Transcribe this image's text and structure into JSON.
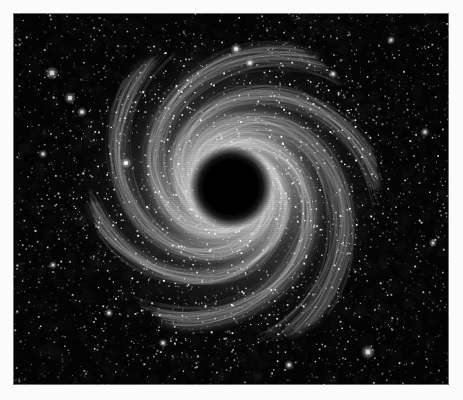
{
  "figure": {
    "title": "Spiral galaxy photographic plate",
    "medium": "monochrome astronomical photographic plate",
    "canvas_width": 463,
    "canvas_height": 400,
    "margin_color": "#fbfbfb",
    "plate": {
      "x": 13,
      "y": 13,
      "width": 436,
      "height": 372,
      "background_color": "#050505",
      "border_color": "#c8c8c8"
    },
    "has_visible_text": false,
    "visible_labels": []
  },
  "chart_data": {
    "type": "scatter",
    "title": "",
    "xlabel": "",
    "ylabel": "",
    "grid": false,
    "legend": null,
    "xlim": [
      0,
      436
    ],
    "ylim": [
      0,
      372
    ],
    "galaxy": {
      "name": "face-on spiral galaxy",
      "center_x": 218,
      "center_y": 174,
      "core": {
        "kind": "saturated-dark-nucleus",
        "color": "#000000",
        "radius": 26,
        "soft_edge_radius": 42
      },
      "halo": {
        "inner_radius": 30,
        "outer_radius": 165,
        "peak_brightness": 0.86,
        "color_bright": "#e8e8e8",
        "color_mid": "#9a9a9a",
        "color_faint": "#3a3a3a"
      },
      "arm_count": 6,
      "arm_winding": "counterclockwise",
      "arm_pitch_deg": 19,
      "arms": [
        {
          "start_angle_deg": 10,
          "length": 155,
          "brightness": 0.92,
          "width": 22
        },
        {
          "start_angle_deg": 70,
          "length": 148,
          "brightness": 0.8,
          "width": 20
        },
        {
          "start_angle_deg": 128,
          "length": 160,
          "brightness": 0.88,
          "width": 24
        },
        {
          "start_angle_deg": 190,
          "length": 150,
          "brightness": 0.95,
          "width": 23
        },
        {
          "start_angle_deg": 250,
          "length": 142,
          "brightness": 0.78,
          "width": 19
        },
        {
          "start_angle_deg": 305,
          "length": 152,
          "brightness": 0.85,
          "width": 21
        }
      ]
    },
    "starfield": {
      "count": 5200,
      "seed": 20240517,
      "radius_range": [
        0.4,
        1.9
      ],
      "brightness_range": [
        0.12,
        1.0
      ],
      "color": "#ffffff"
    },
    "bright_stars": [
      {
        "x": 39,
        "y": 60,
        "r": 2.6,
        "b": 1.0
      },
      {
        "x": 57,
        "y": 85,
        "r": 2.3,
        "b": 0.96
      },
      {
        "x": 69,
        "y": 99,
        "r": 2.0,
        "b": 0.9
      },
      {
        "x": 30,
        "y": 141,
        "r": 1.8,
        "b": 0.84
      },
      {
        "x": 113,
        "y": 150,
        "r": 2.2,
        "b": 0.95
      },
      {
        "x": 223,
        "y": 36,
        "r": 2.2,
        "b": 0.94
      },
      {
        "x": 237,
        "y": 50,
        "r": 1.9,
        "b": 0.88
      },
      {
        "x": 320,
        "y": 61,
        "r": 1.8,
        "b": 0.86
      },
      {
        "x": 378,
        "y": 27,
        "r": 1.8,
        "b": 0.85
      },
      {
        "x": 412,
        "y": 119,
        "r": 1.9,
        "b": 0.88
      },
      {
        "x": 355,
        "y": 339,
        "r": 2.8,
        "b": 1.0
      },
      {
        "x": 276,
        "y": 352,
        "r": 1.9,
        "b": 0.88
      },
      {
        "x": 96,
        "y": 300,
        "r": 1.8,
        "b": 0.84
      },
      {
        "x": 150,
        "y": 330,
        "r": 1.8,
        "b": 0.82
      },
      {
        "x": 420,
        "y": 230,
        "r": 1.7,
        "b": 0.82
      },
      {
        "x": 40,
        "y": 252,
        "r": 1.7,
        "b": 0.8
      }
    ]
  }
}
